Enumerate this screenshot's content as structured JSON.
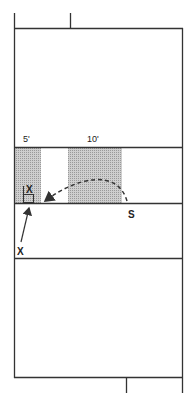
{
  "diagram": {
    "labels": {
      "five_foot": "5'",
      "ten_foot": "10'",
      "server": "S",
      "player_near_net": "X",
      "player_outside": "X"
    },
    "colors": {
      "line": "#333333",
      "shade": "#bdbdbd",
      "background": "#ffffff"
    }
  }
}
